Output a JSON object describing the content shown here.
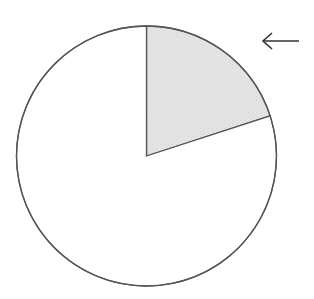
{
  "chart_data": {
    "type": "pie",
    "title": "",
    "slices": [
      {
        "label": "highlighted",
        "value": 20,
        "color": "#e3e3e3",
        "hatched": true
      },
      {
        "label": "rest",
        "value": 80,
        "color": "#ffffff",
        "hatched": false
      }
    ],
    "start_angle_deg": 0,
    "direction": "clockwise",
    "annotations": [
      {
        "type": "arrow",
        "points_to": "highlighted",
        "direction": "left"
      }
    ],
    "legend": null
  },
  "colors": {
    "stroke": "#555555",
    "highlight_fill": "#e3e3e3",
    "arrow": "#333333"
  }
}
